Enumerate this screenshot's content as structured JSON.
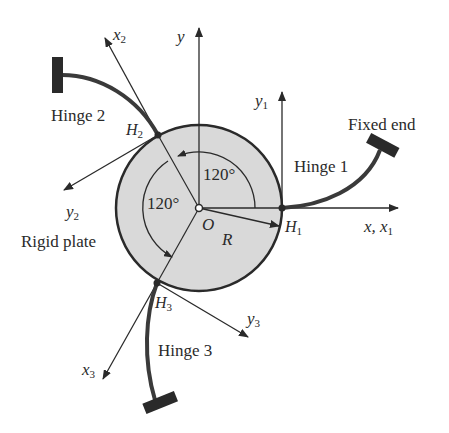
{
  "diagram": {
    "type": "mechanism-schematic",
    "colors": {
      "line": "#2a2a2a",
      "plate_fill": "#d9d9d9",
      "background": "#ffffff"
    },
    "labels": {
      "hinge1": "Hinge 1",
      "hinge2": "Hinge 2",
      "hinge3": "Hinge 3",
      "fixed_end": "Fixed end",
      "rigid_plate": "Rigid plate",
      "center": "O",
      "radius": "R",
      "angle_top": "120°",
      "angle_left": "120°"
    },
    "axes": {
      "y": "y",
      "x_x1": "x, x",
      "x_x1_sub": "1",
      "y1": "y",
      "y1_sub": "1",
      "x2": "x",
      "x2_sub": "2",
      "y2": "y",
      "y2_sub": "2",
      "x3": "x",
      "x3_sub": "3",
      "y3": "y",
      "y3_sub": "3"
    },
    "points": {
      "h1": "H",
      "h1_sub": "1",
      "h2": "H",
      "h2_sub": "2",
      "h3": "H",
      "h3_sub": "3"
    }
  }
}
